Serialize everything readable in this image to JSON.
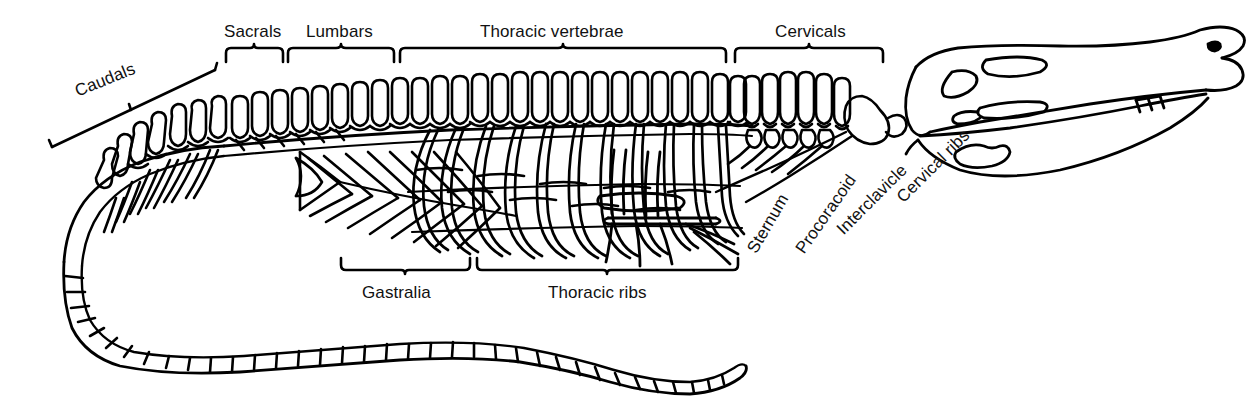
{
  "figure": {
    "background_color": "#ffffff",
    "line_color": "#000000",
    "style": "black-and-white line drawing"
  },
  "labels": {
    "caudals": "Caudals",
    "sacrals": "Sacrals",
    "lumbars": "Lumbars",
    "thoracic_vertebrae": "Thoracic vertebrae",
    "cervicals": "Cervicals",
    "gastralia": "Gastralia",
    "thoracic_ribs": "Thoracic ribs",
    "sternum": "Sternum",
    "procoracoid": "Procoracoid",
    "interclavicle": "Interclavicle",
    "cervical_ribs": "Cervical ribs"
  },
  "label_placement": [
    {
      "key": "caudals",
      "x": 76,
      "y": 92,
      "rotation": -22,
      "type": "rotated-label"
    },
    {
      "key": "sacrals",
      "x": 224,
      "y": 22,
      "rotation": 0,
      "type": "brace-label"
    },
    {
      "key": "lumbars",
      "x": 306,
      "y": 22,
      "rotation": 0,
      "type": "brace-label"
    },
    {
      "key": "thoracic_vertebrae",
      "x": 480,
      "y": 22,
      "rotation": 0,
      "type": "brace-label"
    },
    {
      "key": "cervicals",
      "x": 775,
      "y": 22,
      "rotation": 0,
      "type": "brace-label"
    },
    {
      "key": "gastralia",
      "x": 362,
      "y": 283,
      "rotation": 0,
      "type": "brace-label"
    },
    {
      "key": "thoracic_ribs",
      "x": 548,
      "y": 283,
      "rotation": 0,
      "type": "brace-label"
    },
    {
      "key": "sternum",
      "x": 752,
      "y": 252,
      "rotation": -60,
      "type": "leader-label"
    },
    {
      "key": "procoracoid",
      "x": 800,
      "y": 252,
      "rotation": -55,
      "type": "leader-label"
    },
    {
      "key": "interclavicle",
      "x": 840,
      "y": 232,
      "rotation": -45,
      "type": "leader-label"
    },
    {
      "key": "cervical_ribs",
      "x": 900,
      "y": 200,
      "rotation": -45,
      "type": "leader-label"
    }
  ],
  "braces": [
    {
      "key": "sacrals",
      "orientation": "top",
      "x_start": 226,
      "x_end": 283,
      "y": 56
    },
    {
      "key": "lumbars",
      "orientation": "top",
      "x_start": 288,
      "x_end": 394,
      "y": 56
    },
    {
      "key": "thoracic_vertebrae",
      "orientation": "top",
      "x_start": 400,
      "x_end": 726,
      "y": 56
    },
    {
      "key": "cervicals",
      "orientation": "top",
      "x_start": 735,
      "x_end": 883,
      "y": 56
    },
    {
      "key": "gastralia",
      "orientation": "bottom",
      "x_start": 341,
      "x_end": 470,
      "y": 266
    },
    {
      "key": "thoracic_ribs",
      "orientation": "bottom",
      "x_start": 477,
      "x_end": 738,
      "y": 266
    }
  ],
  "caudals_rule": {
    "x_start": 52,
    "y_start": 147,
    "x_end": 215,
    "y_end": 70
  },
  "skeleton_parts": [
    "skull",
    "lower jaw",
    "teeth",
    "orbit",
    "antorbital fenestra",
    "supratemporal fenestra",
    "cervical vertebrae",
    "cervical ribs",
    "thoracic vertebrae",
    "neural spines",
    "thoracic ribs",
    "gastralia",
    "sternum",
    "interclavicle",
    "procoracoid",
    "lumbar vertebrae",
    "sacral vertebrae",
    "caudal vertebrae",
    "tail"
  ],
  "counts": {
    "caudal_blocks_distal": 34,
    "thoracic_ribs": 11,
    "gastralia_chevrons": 9,
    "cervical_vertebrae": 9
  }
}
